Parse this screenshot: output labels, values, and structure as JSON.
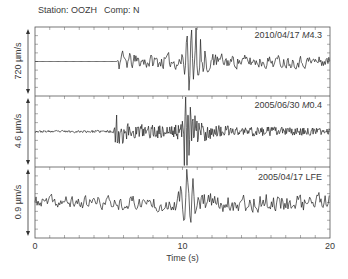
{
  "header": {
    "station_label": "Station: OOZH",
    "component_label": "Comp: N"
  },
  "axis": {
    "x_ticks": [
      {
        "value": 0,
        "label": "0"
      },
      {
        "value": 10,
        "label": "10"
      },
      {
        "value": 20,
        "label": "20"
      }
    ],
    "xlabel": "Time (s)"
  },
  "panels": [
    {
      "date": "2010/04/17 ",
      "mag_prefix": "M",
      "mag_value": "4.3",
      "scale_label": "720 µm/s"
    },
    {
      "date": "2005/06/30 ",
      "mag_prefix": "M",
      "mag_value": "0.4",
      "scale_label": "4.6 µm/s"
    },
    {
      "date": "2005/04/17 ",
      "mag_prefix": "",
      "mag_value": "LFE",
      "scale_label": "0.9 µm/s"
    }
  ],
  "colors": {
    "trace": "#222222",
    "frame": "#555555",
    "text": "#3a3a3a",
    "background": "#ffffff"
  },
  "chart_data": {
    "type": "line",
    "title": "Station: OOZH  Comp: N",
    "xlabel": "Time (s)",
    "ylabel": "",
    "xlim": [
      0,
      20
    ],
    "x_ticks": [
      0,
      10,
      20
    ],
    "x_minor_tick_step": 1,
    "grid": false,
    "legend": "none",
    "layout": "3 stacked panels sharing time axis",
    "panels": [
      {
        "name": "2010/04/17 M4.3",
        "scale": "720 µm/s",
        "onset_s": 5.6,
        "peak_time_s": 10.4,
        "seed": 11,
        "dt": 0.06,
        "smooth": 0.35,
        "noise_envelope": [
          [
            0,
            0.0
          ],
          [
            5.55,
            0.0
          ],
          [
            5.6,
            0.38
          ],
          [
            6.1,
            0.3
          ],
          [
            7.0,
            0.24
          ],
          [
            9.8,
            0.25
          ],
          [
            10.1,
            0.3
          ],
          [
            12.0,
            0.3
          ],
          [
            13.0,
            0.22
          ],
          [
            20,
            0.2
          ]
        ],
        "bursts": [
          {
            "t0": 9.9,
            "t1": 12.2,
            "freq_hz": 3.2,
            "amp": 0.95
          }
        ]
      },
      {
        "name": "2005/06/30 M0.4",
        "scale": "4.6 µm/s",
        "onset_s": 5.4,
        "peak_time_s": 10.3,
        "seed": 23,
        "dt": 0.045,
        "smooth": 0.1,
        "noise_envelope": [
          [
            0,
            0.03
          ],
          [
            5.35,
            0.04
          ],
          [
            5.4,
            0.75
          ],
          [
            5.7,
            0.45
          ],
          [
            6.3,
            0.28
          ],
          [
            7.5,
            0.2
          ],
          [
            9.9,
            0.24
          ],
          [
            10.1,
            0.7
          ],
          [
            10.5,
            0.6
          ],
          [
            11.2,
            0.35
          ],
          [
            12.5,
            0.18
          ],
          [
            20,
            0.1
          ]
        ],
        "bursts": [
          {
            "t0": 10.0,
            "t1": 11.0,
            "freq_hz": 6.0,
            "amp": 0.8
          }
        ]
      },
      {
        "name": "2005/04/17 LFE",
        "scale": "0.9 µm/s",
        "onset_s": null,
        "peak_time_s": 10.4,
        "seed": 37,
        "dt": 0.07,
        "smooth": 0.45,
        "noise_envelope": [
          [
            0,
            0.22
          ],
          [
            6.0,
            0.24
          ],
          [
            9.5,
            0.32
          ],
          [
            10.0,
            0.45
          ],
          [
            11.0,
            0.45
          ],
          [
            11.8,
            0.35
          ],
          [
            20,
            0.32
          ]
        ],
        "bursts": [
          {
            "t0": 9.8,
            "t1": 11.4,
            "freq_hz": 2.4,
            "amp": 0.95
          }
        ]
      }
    ]
  }
}
